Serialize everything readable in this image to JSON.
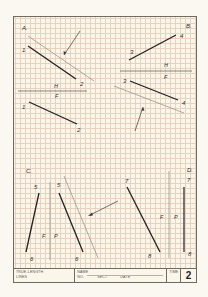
{
  "worksheet": {
    "sheet_number": "2",
    "title_line1": "TRUE-LENGTH",
    "title_line2": "LINES",
    "fields": {
      "name_label": "NAME",
      "no_label": "NO.",
      "sect_label": "SECT",
      "date_label": "DATE",
      "time_label": "TIME"
    },
    "colors": {
      "paper": "#fbf6ea",
      "grid": "#e6d2bf",
      "ink": "#2f2f2f",
      "light_line": "#8f8a82"
    }
  },
  "panels": {
    "A": {
      "label": "A.",
      "top_view_points": [
        "1",
        "2"
      ],
      "front_view_points": [
        "1",
        "2"
      ],
      "fold_line_top": "H",
      "fold_line_bottom": "F"
    },
    "B": {
      "label": "B.",
      "top_view_points": [
        "3",
        "4"
      ],
      "front_view_points": [
        "3",
        "4"
      ],
      "fold_line_top": "H",
      "fold_line_bottom": "F"
    },
    "C": {
      "label": "C.",
      "front_view_points": [
        "5",
        "6"
      ],
      "profile_view_points": [
        "5",
        "6"
      ],
      "fold_line_left": "F",
      "fold_line_right": "P"
    },
    "D": {
      "label": "D.",
      "front_view_points": [
        "7",
        "8"
      ],
      "profile_view_points": [
        "7",
        "8"
      ],
      "fold_line_left": "F",
      "fold_line_right": "P"
    }
  }
}
